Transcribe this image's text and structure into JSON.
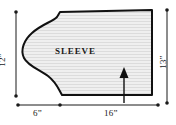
{
  "figure": {
    "title": "SLEEVE",
    "piece_label": "SLEEVE",
    "units": "inches",
    "fill_color": "#ebebeb",
    "outline_color": "#111111",
    "dimension_color": "#1a1a1a",
    "hatch_color": "#d9d9d9"
  },
  "labels": {
    "piece": "SLEEVE",
    "left_height": "12”",
    "right_height": "13”",
    "bottom_left_width": "6”",
    "bottom_right_width": "16”"
  },
  "dimensions": [
    {
      "name": "left-height",
      "value": "12”",
      "orientation": "vertical",
      "side": "left"
    },
    {
      "name": "right-height",
      "value": "13”",
      "orientation": "vertical",
      "side": "right"
    },
    {
      "name": "bottom-left-width",
      "value": "6”",
      "orientation": "horizontal",
      "side": "bottom"
    },
    {
      "name": "bottom-right-width",
      "value": "16”",
      "orientation": "horizontal",
      "side": "bottom"
    }
  ],
  "annotations": {
    "grain_arrow": "up-arrow"
  }
}
